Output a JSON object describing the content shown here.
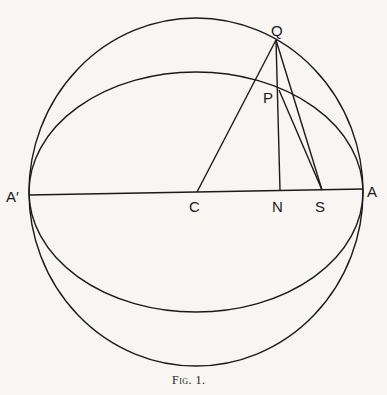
{
  "figure": {
    "caption": "Fig. 1.",
    "labels": {
      "Q": "Q",
      "P": "P",
      "A_prime": "A′",
      "C": "C",
      "N": "N",
      "S": "S",
      "A": "A"
    },
    "stroke_color": "#1a1a1a",
    "background": "#f7f6f3"
  }
}
